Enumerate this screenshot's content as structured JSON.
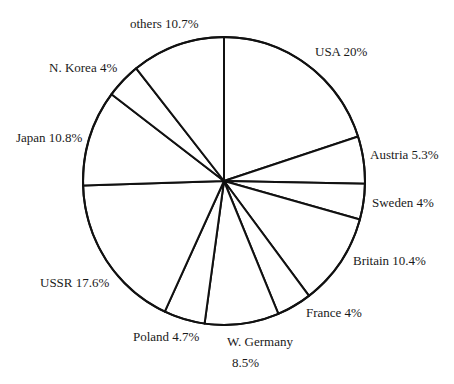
{
  "chart_data": {
    "type": "pie",
    "title": "",
    "start_angle_deg": 0,
    "direction": "clockwise",
    "categories": [
      "USA",
      "Austria",
      "Sweden",
      "Britain",
      "France",
      "W. Germany",
      "Poland",
      "USSR",
      "Japan",
      "N. Korea",
      "others"
    ],
    "values": [
      20,
      5.3,
      4,
      10.4,
      4,
      8.5,
      4.7,
      17.6,
      10.8,
      4,
      10.7
    ],
    "unit": "%",
    "fill": "#ffffff",
    "stroke": "#111111",
    "center": [
      224,
      181
    ],
    "radius_x": 141,
    "radius_y": 144
  },
  "labels": [
    {
      "text": "USA 20%",
      "x": 315,
      "y": 45
    },
    {
      "text": "Austria 5.3%",
      "x": 370,
      "y": 148
    },
    {
      "text": "Sweden 4%",
      "x": 372,
      "y": 196
    },
    {
      "text": "Britain 10.4%",
      "x": 353,
      "y": 254
    },
    {
      "text": "France 4%",
      "x": 306,
      "y": 306
    },
    {
      "text": "W. Germany",
      "x": 227,
      "y": 335
    },
    {
      "text": "8.5%",
      "x": 232,
      "y": 356
    },
    {
      "text": "Poland 4.7%",
      "x": 133,
      "y": 330
    },
    {
      "text": "USSR 17.6%",
      "x": 40,
      "y": 276
    },
    {
      "text": "Japan 10.8%",
      "x": 16,
      "y": 131
    },
    {
      "text": "N. Korea 4%",
      "x": 49,
      "y": 61
    },
    {
      "text": "others 10.7%",
      "x": 130,
      "y": 17
    }
  ]
}
